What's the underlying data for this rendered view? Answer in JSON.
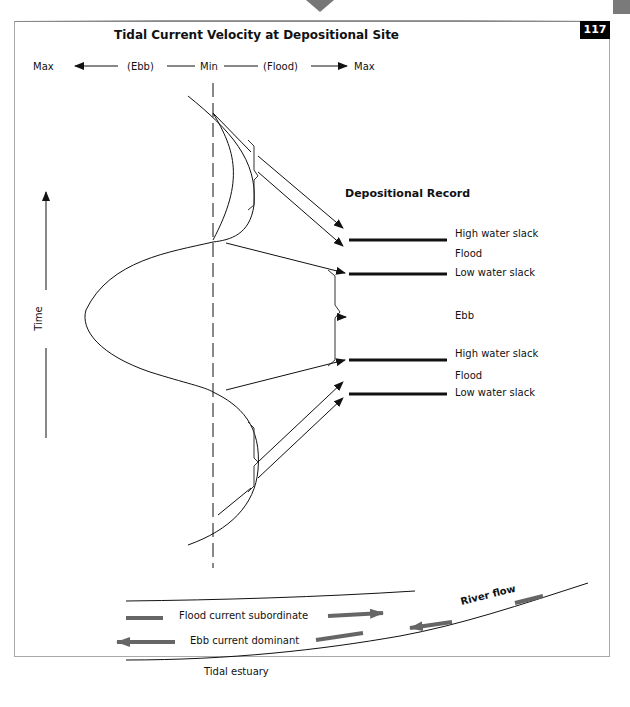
{
  "page": {
    "page_number": "117"
  },
  "header": {
    "title": "Tidal Current Velocity at Depositional Site",
    "axis": {
      "left_max": "Max",
      "ebb": "(Ebb)",
      "min": "Min",
      "flood": "(Flood)",
      "right_max": "Max"
    }
  },
  "time_axis": {
    "label": "Time"
  },
  "depositional_record": {
    "title": "Depositional Record",
    "entries": [
      {
        "label": "High water slack",
        "type": "layer"
      },
      {
        "label": "Flood",
        "type": "interval"
      },
      {
        "label": "Low water slack",
        "type": "layer"
      },
      {
        "label": "Ebb",
        "type": "interval"
      },
      {
        "label": "High water slack",
        "type": "layer"
      },
      {
        "label": "Flood",
        "type": "interval"
      },
      {
        "label": "Low water slack",
        "type": "layer"
      }
    ]
  },
  "estuary": {
    "legend_flood": "Flood current subordinate",
    "legend_ebb": "Ebb current dominant",
    "river_flow": "River flow",
    "caption": "Tidal estuary"
  },
  "colors": {
    "line": "#111111",
    "arrow_gray": "#666666",
    "badge_bg": "#000000",
    "frame": "#aaaaaa"
  }
}
